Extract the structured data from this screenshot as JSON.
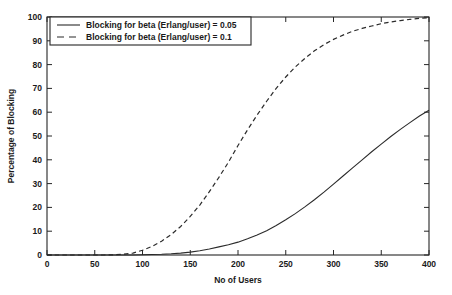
{
  "chart_data": {
    "type": "line",
    "title": "",
    "xlabel": "No of Users",
    "ylabel": "Percentage of Blocking",
    "xlim": [
      0,
      400
    ],
    "ylim": [
      0,
      100
    ],
    "xticks": [
      0,
      50,
      100,
      150,
      200,
      250,
      300,
      350,
      400
    ],
    "xtick_labels": [
      "0",
      "50",
      "100",
      "150",
      "200",
      "250",
      "300",
      "350",
      "400"
    ],
    "yticks": [
      0,
      10,
      20,
      30,
      40,
      50,
      60,
      70,
      80,
      90,
      100
    ],
    "ytick_labels": [
      "0",
      "10",
      "20",
      "30",
      "40",
      "50",
      "60",
      "70",
      "80",
      "90",
      "100"
    ],
    "grid": false,
    "legend_position": "upper-left",
    "x": [
      0,
      20,
      40,
      60,
      70,
      80,
      90,
      100,
      110,
      120,
      130,
      140,
      150,
      160,
      170,
      180,
      190,
      200,
      210,
      220,
      230,
      240,
      250,
      260,
      270,
      280,
      290,
      300,
      310,
      320,
      330,
      340,
      350,
      360,
      370,
      380,
      390,
      400
    ],
    "series": [
      {
        "name": "Blocking for beta (Erlang/user) = 0.05",
        "style": "solid",
        "color": "#2b2b2b",
        "values": [
          0,
          0,
          0,
          0,
          0,
          0,
          0,
          0.1,
          0.2,
          0.3,
          0.5,
          0.8,
          1.2,
          1.8,
          2.5,
          3.4,
          4.3,
          5.4,
          6.8,
          8.4,
          10.2,
          12.4,
          14.8,
          17.4,
          20.2,
          23.2,
          26.4,
          29.8,
          33.2,
          36.6,
          40.0,
          43.4,
          46.6,
          49.8,
          52.8,
          55.6,
          58.4,
          60.8
        ]
      },
      {
        "name": "Blocking for beta (Erlang/user) = 0.1",
        "style": "dashed",
        "color": "#2b2b2b",
        "values": [
          0,
          0,
          0,
          0,
          0.1,
          0.3,
          0.8,
          2.0,
          3.6,
          5.8,
          8.6,
          12.0,
          16.2,
          21.0,
          26.6,
          32.6,
          39.0,
          46.0,
          52.6,
          58.8,
          64.6,
          70.0,
          74.8,
          79.0,
          82.6,
          85.8,
          88.4,
          90.6,
          92.4,
          94.0,
          95.2,
          96.2,
          97.2,
          97.9,
          98.5,
          99.0,
          99.4,
          99.7
        ]
      }
    ],
    "legend": [
      {
        "label": "Blocking for beta (Erlang/user) = 0.05",
        "style": "solid"
      },
      {
        "label": "Blocking for beta (Erlang/user) = 0.1",
        "style": "dashed"
      }
    ]
  }
}
